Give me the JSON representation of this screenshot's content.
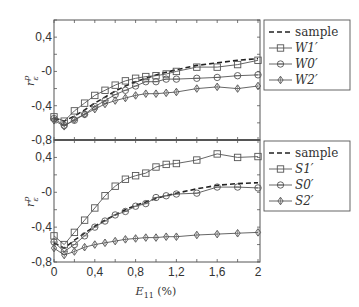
{
  "chart_data": [
    {
      "type": "line",
      "panel": "top",
      "title": "",
      "xlabel": "",
      "ylabel": "r_ε^p",
      "xlim": [
        0,
        2
      ],
      "ylim": [
        -0.8,
        0.6
      ],
      "yticks": [
        "0,4",
        "-0",
        "-0,4",
        "-0,8"
      ],
      "ytick_values": [
        0.4,
        0,
        -0.4,
        -0.8
      ],
      "legend": {
        "position": "right-outside",
        "entries": [
          "sample",
          "W1′",
          "W0′",
          "W2′"
        ]
      },
      "x": [
        0,
        0.1,
        0.2,
        0.3,
        0.4,
        0.5,
        0.6,
        0.7,
        0.8,
        0.9,
        1.0,
        1.1,
        1.2,
        1.4,
        1.6,
        1.8,
        2.0
      ],
      "series": [
        {
          "name": "sample",
          "style": "dashed",
          "marker": "none",
          "values": [
            -0.55,
            -0.58,
            -0.52,
            -0.45,
            -0.37,
            -0.3,
            -0.23,
            -0.17,
            -0.12,
            -0.08,
            -0.04,
            -0.01,
            0.02,
            0.07,
            0.1,
            0.13,
            0.15
          ]
        },
        {
          "name": "W1′",
          "style": "solid",
          "marker": "square",
          "values": [
            -0.53,
            -0.58,
            -0.46,
            -0.37,
            -0.28,
            -0.22,
            -0.16,
            -0.11,
            -0.08,
            -0.06,
            -0.05,
            -0.03,
            0.0,
            0.05,
            0.05,
            0.08,
            0.13
          ]
        },
        {
          "name": "W0′",
          "style": "solid",
          "marker": "circle",
          "values": [
            -0.55,
            -0.63,
            -0.57,
            -0.5,
            -0.41,
            -0.34,
            -0.27,
            -0.22,
            -0.17,
            -0.12,
            -0.12,
            -0.09,
            -0.09,
            -0.08,
            -0.07,
            -0.05,
            -0.04
          ]
        },
        {
          "name": "W2′",
          "style": "solid",
          "marker": "diamond",
          "values": [
            -0.57,
            -0.64,
            -0.56,
            -0.5,
            -0.44,
            -0.38,
            -0.34,
            -0.31,
            -0.28,
            -0.26,
            -0.26,
            -0.25,
            -0.24,
            -0.2,
            -0.18,
            -0.2,
            -0.17
          ]
        }
      ]
    },
    {
      "type": "line",
      "panel": "bottom",
      "title": "",
      "xlabel": "E11 (%)",
      "ylabel": "r_ε^p",
      "xlim": [
        0,
        2
      ],
      "ylim": [
        -0.8,
        0.6
      ],
      "xticks": [
        "0",
        "0,4",
        "0,8",
        "1,2",
        "1,6",
        "2"
      ],
      "xtick_values": [
        0,
        0.4,
        0.8,
        1.2,
        1.6,
        2
      ],
      "yticks": [
        "0,4",
        "-0",
        "-0,4",
        "-0,8"
      ],
      "ytick_values": [
        0.4,
        0,
        -0.4,
        -0.8
      ],
      "legend": {
        "position": "right-outside",
        "entries": [
          "sample",
          "S1′",
          "S0′",
          "S2′"
        ]
      },
      "x": [
        0,
        0.1,
        0.2,
        0.3,
        0.4,
        0.5,
        0.6,
        0.7,
        0.8,
        0.9,
        1.0,
        1.1,
        1.2,
        1.4,
        1.6,
        1.8,
        2.0
      ],
      "series": [
        {
          "name": "sample",
          "style": "dashed",
          "marker": "none",
          "values": [
            -0.58,
            -0.64,
            -0.55,
            -0.47,
            -0.39,
            -0.32,
            -0.26,
            -0.2,
            -0.15,
            -0.11,
            -0.07,
            -0.04,
            -0.01,
            0.04,
            0.08,
            0.1,
            0.11
          ]
        },
        {
          "name": "S1′",
          "style": "solid",
          "marker": "square",
          "values": [
            -0.5,
            -0.6,
            -0.46,
            -0.32,
            -0.18,
            -0.04,
            0.07,
            0.15,
            0.19,
            0.22,
            0.29,
            0.32,
            0.33,
            0.37,
            0.44,
            0.4,
            0.41
          ]
        },
        {
          "name": "S0′",
          "style": "solid",
          "marker": "circle",
          "values": [
            -0.57,
            -0.68,
            -0.6,
            -0.5,
            -0.4,
            -0.33,
            -0.26,
            -0.22,
            -0.16,
            -0.13,
            -0.06,
            -0.04,
            -0.02,
            -0.01,
            0.06,
            0.06,
            0.05
          ]
        },
        {
          "name": "S2′",
          "style": "solid",
          "marker": "diamond",
          "values": [
            -0.64,
            -0.72,
            -0.68,
            -0.63,
            -0.6,
            -0.58,
            -0.56,
            -0.54,
            -0.53,
            -0.52,
            -0.52,
            -0.51,
            -0.51,
            -0.49,
            -0.48,
            -0.47,
            -0.46
          ]
        }
      ]
    }
  ],
  "labels": {
    "y_axis_top": "r",
    "y_axis_sup": "p",
    "y_axis_sub": "ε",
    "x_axis_main": "E",
    "x_axis_sub": "11",
    "x_axis_unit": " (%)"
  },
  "colors": {
    "axes": "#555555",
    "line": "#555555",
    "sample": "#222222",
    "background": "#ffffff"
  }
}
